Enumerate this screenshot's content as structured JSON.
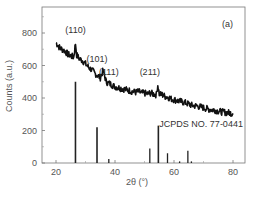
{
  "chart_data": {
    "type": "line",
    "title": "",
    "panel_label": "(a)",
    "xlabel": "2θ (°)",
    "ylabel": "Counts (a.u.)",
    "xlim": [
      15,
      84
    ],
    "ylim": [
      0,
      960
    ],
    "xticks": [
      20,
      40,
      60,
      80
    ],
    "yticks": [
      0,
      200,
      400,
      600,
      800
    ],
    "grid": false,
    "series": [
      {
        "name": "Measured XRD pattern",
        "style": "noisy line",
        "x": [
          20,
          21,
          22,
          23,
          24,
          25,
          26,
          26.6,
          27,
          28,
          29,
          30,
          31,
          32,
          33,
          34,
          35,
          36,
          37,
          38,
          39,
          40,
          41,
          42,
          43,
          44,
          45,
          46,
          47,
          48,
          49,
          50,
          51,
          52,
          53,
          54,
          54.5,
          55,
          56,
          57,
          58,
          59,
          60,
          62,
          64,
          66,
          68,
          70,
          72,
          74,
          76,
          78,
          80
        ],
        "y": [
          740,
          715,
          700,
          690,
          670,
          660,
          650,
          735,
          665,
          640,
          630,
          610,
          590,
          575,
          555,
          540,
          525,
          570,
          500,
          490,
          480,
          470,
          465,
          460,
          455,
          450,
          445,
          440,
          435,
          440,
          430,
          430,
          425,
          430,
          425,
          420,
          480,
          425,
          420,
          410,
          405,
          395,
          390,
          380,
          370,
          355,
          350,
          340,
          330,
          325,
          315,
          310,
          305
        ]
      },
      {
        "name": "JCPDS NO. 77-0441",
        "style": "sticks",
        "x": [
          26.6,
          33.9,
          37.9,
          51.8,
          54.7,
          57.8,
          61.9,
          64.7,
          65.9
        ],
        "y": [
          500,
          220,
          25,
          90,
          230,
          60,
          10,
          75,
          10
        ]
      }
    ],
    "annotations": [
      {
        "text": "(110)",
        "x": 26.6,
        "y": 800
      },
      {
        "text": "(101)",
        "x": 33.9,
        "y": 620
      },
      {
        "text": "(111)",
        "x": 37.9,
        "y": 540
      },
      {
        "text": "(211)",
        "x": 51.8,
        "y": 540
      },
      {
        "text": "JCPDS NO. 77-0441",
        "x": 54.7,
        "y": 220
      }
    ]
  }
}
